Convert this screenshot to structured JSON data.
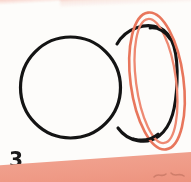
{
  "page": {
    "background_color": "#fdfcfa",
    "width": 191,
    "height": 182
  },
  "figure": {
    "number_label": "3",
    "caption": "",
    "ink_color": "#141414",
    "highlight_color": "#e8765c",
    "highlight_color_inner": "#ef8f78",
    "shapes": [
      {
        "name": "sphere-circle",
        "type": "circle",
        "stroke": "#141414",
        "cx": 70,
        "cy": 87,
        "r": 50
      },
      {
        "name": "ring-body-ellipse",
        "type": "ellipse",
        "stroke": "#141414",
        "cx": 137,
        "cy": 84,
        "rx": 38,
        "ry": 58
      },
      {
        "name": "highlight-ring-outer",
        "type": "ellipse",
        "stroke": "#e8765c",
        "cx": 157,
        "cy": 81,
        "rx": 26,
        "ry": 69,
        "rotation": -8
      },
      {
        "name": "highlight-ring-inner",
        "type": "ellipse",
        "stroke": "#ef8f78",
        "cx": 157,
        "cy": 81,
        "rx": 20,
        "ry": 63,
        "rotation": -8
      }
    ]
  },
  "decoration": {
    "top_band_color": "#e9836e",
    "bottom_band_color": "#ef9a86",
    "top_band_label": "scan-edge-top",
    "bottom_band_label": "scan-edge-bottom",
    "edge_mark_label": "ink-smudge"
  }
}
